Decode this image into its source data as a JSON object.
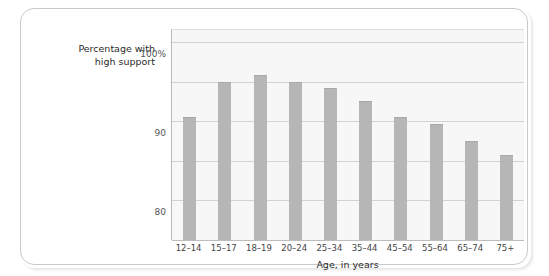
{
  "chart_data": {
    "type": "bar",
    "title": "",
    "subtitle": "",
    "xlabel": "Age, in years",
    "ylabel": "Percentage with\nhigh support",
    "categories": [
      "12–14",
      "15–17",
      "18–19",
      "20–24",
      "25–34",
      "35–44",
      "45–54",
      "55–64",
      "65–74",
      "75+"
    ],
    "values": [
      81,
      90,
      91.7,
      90,
      88.4,
      85,
      81,
      79.2,
      75,
      71.5
    ],
    "ylim": [
      50,
      103
    ],
    "yticks": [
      50,
      60,
      70,
      80,
      90,
      100
    ],
    "ytick_labels": [
      "50",
      "60",
      "70",
      "80",
      "90",
      "100%"
    ],
    "grid": true,
    "legend": "none",
    "bar_color": "#b6b6b6",
    "plot_background": "#f7f7f7",
    "gridline_color": "#d2d2d2",
    "axis_color": "#b9b9b9"
  },
  "figure": {
    "frame_border_color": "#c9c9c9",
    "page_background": "#ffffff"
  }
}
